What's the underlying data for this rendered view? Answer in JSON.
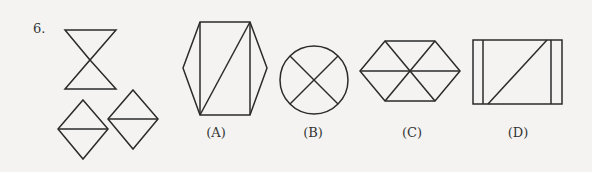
{
  "question": {
    "number": "6.",
    "given_figures": [
      "hourglass (two triangles meeting at apex)",
      "square diamond split horizontally",
      "square diamond split horizontally"
    ],
    "options": [
      {
        "label": "(A)",
        "shape": "hexagon with inner rectangle and diagonal"
      },
      {
        "label": "(B)",
        "shape": "circle with X"
      },
      {
        "label": "(C)",
        "shape": "hexagon divided into six triangles"
      },
      {
        "label": "(D)",
        "shape": "rectangle with two vertical lines and a diagonal"
      }
    ]
  }
}
